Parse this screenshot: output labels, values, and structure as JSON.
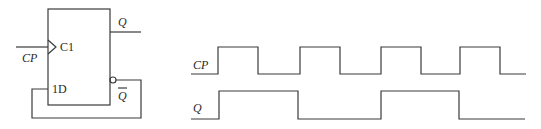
{
  "flipflop": {
    "clock_pin_label": "C1",
    "data_pin_label": "1D",
    "clock_input_label": "CP",
    "q_output_label": "Q",
    "qbar_output_label": "Q"
  },
  "timing": {
    "signals": [
      {
        "name": "CP",
        "low_y": 74,
        "high_y": 47,
        "start_x": 191,
        "end_x": 526,
        "edges": [
          218,
          258,
          300,
          340,
          381,
          421,
          460,
          500
        ],
        "initial": "low"
      },
      {
        "name": "Q",
        "low_y": 119,
        "high_y": 91,
        "start_x": 191,
        "end_x": 525,
        "edges": [
          219,
          298,
          381,
          459
        ],
        "initial": "low"
      }
    ]
  },
  "colors": {
    "line": "#3a3a3a",
    "text": "#2a2a2a",
    "background": "#ffffff"
  }
}
